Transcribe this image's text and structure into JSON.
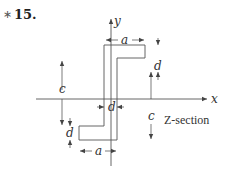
{
  "problem": {
    "marker": "∗",
    "number": "15."
  },
  "diagram": {
    "title": "Z-section",
    "axes": {
      "x_label": "x",
      "y_label": "y"
    },
    "dimensions": {
      "a_top": "a",
      "a_bottom": "a",
      "d_top": "d",
      "d_web": "d",
      "d_bottom": "d",
      "c_left": "c",
      "c_right": "c"
    },
    "colors": {
      "line": "#555555",
      "text": "#333333"
    }
  }
}
